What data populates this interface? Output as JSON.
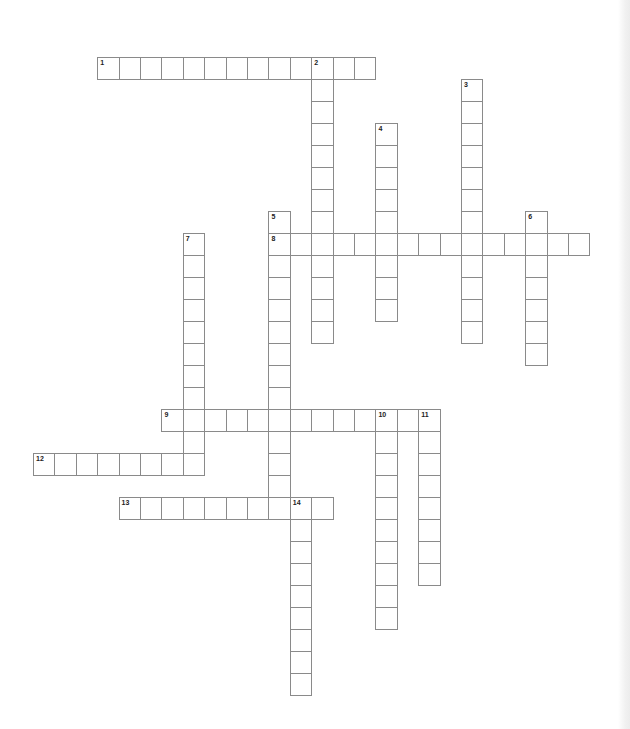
{
  "puzzle": {
    "type": "crossword",
    "cell_width": 21.4,
    "cell_height": 22,
    "origin_x": 33,
    "origin_y": 57,
    "border_color": "#8a8a8a",
    "words": [
      {
        "number": "1",
        "direction": "across",
        "row": 0,
        "col": 3,
        "length": 13
      },
      {
        "number": "2",
        "direction": "down",
        "row": 0,
        "col": 13,
        "length": 13
      },
      {
        "number": "3",
        "direction": "down",
        "row": 1,
        "col": 20,
        "length": 12
      },
      {
        "number": "4",
        "direction": "down",
        "row": 3,
        "col": 16,
        "length": 9
      },
      {
        "number": "5",
        "direction": "down",
        "row": 7,
        "col": 11,
        "length": 14
      },
      {
        "number": "6",
        "direction": "down",
        "row": 7,
        "col": 23,
        "length": 7
      },
      {
        "number": "7",
        "direction": "down",
        "row": 8,
        "col": 7,
        "length": 11
      },
      {
        "number": "8",
        "direction": "across",
        "row": 8,
        "col": 11,
        "length": 15
      },
      {
        "number": "9",
        "direction": "across",
        "row": 16,
        "col": 6,
        "length": 13
      },
      {
        "number": "10",
        "direction": "down",
        "row": 16,
        "col": 16,
        "length": 10
      },
      {
        "number": "11",
        "direction": "down",
        "row": 16,
        "col": 18,
        "length": 8
      },
      {
        "number": "12",
        "direction": "across",
        "row": 18,
        "col": 0,
        "length": 8
      },
      {
        "number": "13",
        "direction": "across",
        "row": 20,
        "col": 4,
        "length": 10
      },
      {
        "number": "14",
        "direction": "down",
        "row": 20,
        "col": 12,
        "length": 9
      }
    ]
  }
}
